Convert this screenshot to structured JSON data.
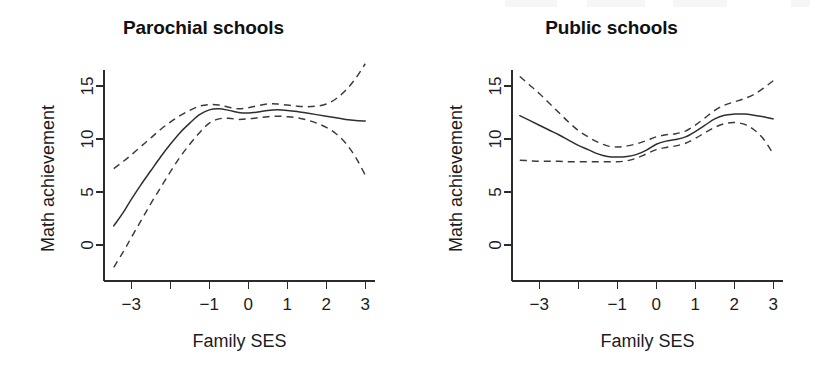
{
  "figure": {
    "background_color": "#ffffff",
    "ink_color": "#2b2b2b"
  },
  "panels": [
    {
      "id": "parochial",
      "title": "Parochial schools",
      "xlabel": "Family SES",
      "ylabel": "Math achievement"
    },
    {
      "id": "public",
      "title": "Public schools",
      "xlabel": "Family SES",
      "ylabel": "Math achievement"
    }
  ],
  "axes": {
    "x_tick_values": [
      -3,
      -2,
      -1,
      0,
      1,
      2,
      3
    ],
    "x_tick_labels": [
      "-3",
      "",
      "-1",
      "0",
      "1",
      "2",
      "3"
    ],
    "y_tick_values": [
      0,
      5,
      10,
      15
    ],
    "y_tick_labels": [
      "0",
      "5",
      "10",
      "15"
    ],
    "xlim": [
      -3.7,
      3.25
    ],
    "ylim": [
      -2.6,
      17.6
    ]
  },
  "chart_data": [
    {
      "type": "line",
      "title": "Parochial schools",
      "xlabel": "Family SES",
      "ylabel": "Math achievement",
      "xlim": [
        -3.7,
        3.25
      ],
      "ylim": [
        -2.6,
        17.6
      ],
      "grid": false,
      "legend": "none",
      "annotations": [
        "solid line = fitted nonparametric regression",
        "dashed lines = pointwise confidence band"
      ],
      "x": [
        -3.45,
        -3.2,
        -3.0,
        -2.75,
        -2.5,
        -2.25,
        -2.0,
        -1.75,
        -1.5,
        -1.25,
        -1.0,
        -0.75,
        -0.5,
        -0.25,
        0.0,
        0.25,
        0.5,
        0.75,
        1.0,
        1.25,
        1.5,
        1.75,
        2.0,
        2.25,
        2.5,
        2.75,
        3.0
      ],
      "series": [
        {
          "name": "fit",
          "style": "solid",
          "values": [
            1.8,
            3.1,
            4.3,
            5.7,
            7.0,
            8.3,
            9.5,
            10.6,
            11.5,
            12.3,
            12.75,
            12.85,
            12.7,
            12.5,
            12.45,
            12.55,
            12.7,
            12.75,
            12.7,
            12.6,
            12.45,
            12.3,
            12.15,
            12.0,
            11.85,
            11.75,
            11.7
          ]
        },
        {
          "name": "upper_confidence_band",
          "style": "dashed",
          "values": [
            7.2,
            7.9,
            8.5,
            9.3,
            10.1,
            10.9,
            11.6,
            12.2,
            12.7,
            13.1,
            13.25,
            13.2,
            13.0,
            12.85,
            12.95,
            13.15,
            13.3,
            13.3,
            13.2,
            13.1,
            13.05,
            13.1,
            13.3,
            13.8,
            14.6,
            15.7,
            17.1
          ]
        },
        {
          "name": "lower_confidence_band",
          "style": "dashed",
          "values": [
            -2.1,
            -0.6,
            0.7,
            2.3,
            3.9,
            5.4,
            6.9,
            8.3,
            9.5,
            10.6,
            11.5,
            11.9,
            11.95,
            11.85,
            11.9,
            12.0,
            12.1,
            12.15,
            12.1,
            12.0,
            11.8,
            11.5,
            11.1,
            10.5,
            9.6,
            8.3,
            6.6
          ]
        }
      ]
    },
    {
      "type": "line",
      "title": "Public schools",
      "xlabel": "Family SES",
      "ylabel": "Math achievement",
      "xlim": [
        -3.7,
        3.25
      ],
      "ylim": [
        -2.6,
        17.6
      ],
      "grid": false,
      "legend": "none",
      "annotations": [
        "solid line = fitted nonparametric regression",
        "dashed lines = pointwise confidence band"
      ],
      "x": [
        -3.5,
        -3.25,
        -3.0,
        -2.75,
        -2.5,
        -2.25,
        -2.0,
        -1.75,
        -1.5,
        -1.25,
        -1.0,
        -0.75,
        -0.5,
        -0.25,
        0.0,
        0.25,
        0.5,
        0.75,
        1.0,
        1.25,
        1.5,
        1.75,
        2.0,
        2.25,
        2.5,
        2.75,
        3.0
      ],
      "series": [
        {
          "name": "fit",
          "style": "solid",
          "values": [
            12.2,
            11.75,
            11.3,
            10.85,
            10.4,
            9.9,
            9.4,
            9.0,
            8.6,
            8.35,
            8.3,
            8.35,
            8.55,
            8.95,
            9.5,
            9.8,
            9.95,
            10.2,
            10.7,
            11.3,
            11.9,
            12.25,
            12.35,
            12.35,
            12.25,
            12.1,
            11.9
          ]
        },
        {
          "name": "upper_confidence_band",
          "style": "dashed",
          "values": [
            15.9,
            15.1,
            14.3,
            13.4,
            12.5,
            11.6,
            10.8,
            10.2,
            9.7,
            9.35,
            9.25,
            9.35,
            9.55,
            9.85,
            10.2,
            10.4,
            10.5,
            10.75,
            11.3,
            12.0,
            12.7,
            13.2,
            13.5,
            13.8,
            14.2,
            14.8,
            15.5
          ]
        },
        {
          "name": "lower_confidence_band",
          "style": "dashed",
          "values": [
            8.0,
            7.95,
            7.9,
            7.9,
            7.9,
            7.85,
            7.85,
            7.85,
            7.85,
            7.85,
            7.85,
            7.95,
            8.2,
            8.6,
            9.0,
            9.2,
            9.35,
            9.6,
            10.05,
            10.6,
            11.1,
            11.45,
            11.55,
            11.4,
            10.9,
            10.0,
            8.6
          ]
        }
      ]
    }
  ]
}
